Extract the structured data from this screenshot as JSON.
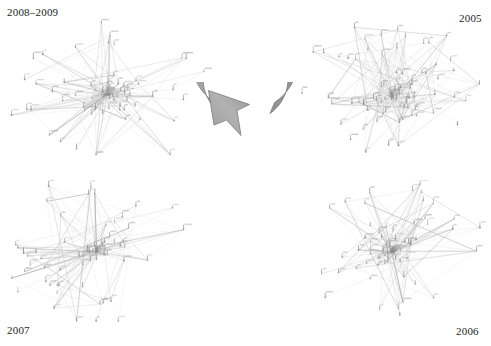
{
  "figure": {
    "background_color": "#ffffff",
    "width": 491,
    "height": 346
  },
  "panels": [
    {
      "id": "top-left",
      "label": "2008–2009",
      "position": "top-left",
      "description": "Dense node-link network diagram, light gray edges, small tick-mark nodes with tiny text labels"
    },
    {
      "id": "top-right",
      "label": "2005",
      "position": "top-right",
      "description": "Node-link network diagram with a dense core and long radiating edges toward the upper right"
    },
    {
      "id": "bottom-left",
      "label": "2007",
      "position": "bottom-left",
      "description": "Node-link network diagram with long triangular spans reaching toward the lower left"
    },
    {
      "id": "bottom-right",
      "label": "2006",
      "position": "bottom-right",
      "description": "Node-link network diagram with a dense core and wide edge fan toward the right"
    }
  ],
  "center_arrow": {
    "name": "cycle-arrow",
    "shape": "circular-arrow",
    "direction": "clockwise",
    "fill_start": "#b9b9b9",
    "fill_end": "#8d8d8d",
    "stroke": "#6f6f6f"
  },
  "colors": {
    "label_text": "#1d1d1d",
    "edge_light": "#d9d9d9",
    "edge_mid": "#c2c2c2",
    "edge_dark": "#a9a9a9",
    "node": "#8f8f8f",
    "node_label": "#b3b3b3",
    "background": "#ffffff"
  },
  "chart_data": {
    "type": "diagram",
    "subtype": "node-link-network-grid",
    "grid": {
      "rows": 2,
      "cols": 2
    },
    "sequence_order": [
      "2005",
      "2006",
      "2007",
      "2008–2009"
    ],
    "sequence_indicator": "clockwise circular arrow at center",
    "panels": [
      {
        "label": "2008–2009",
        "position": "top-left",
        "approx_nodes": 95,
        "approx_edges": 190
      },
      {
        "label": "2005",
        "position": "top-right",
        "approx_nodes": 90,
        "approx_edges": 175
      },
      {
        "label": "2007",
        "position": "bottom-left",
        "approx_nodes": 80,
        "approx_edges": 150
      },
      {
        "label": "2006",
        "position": "bottom-right",
        "approx_nodes": 85,
        "approx_edges": 165
      }
    ],
    "legend": [],
    "xlabel": "",
    "ylabel": "",
    "grid_on": false
  }
}
